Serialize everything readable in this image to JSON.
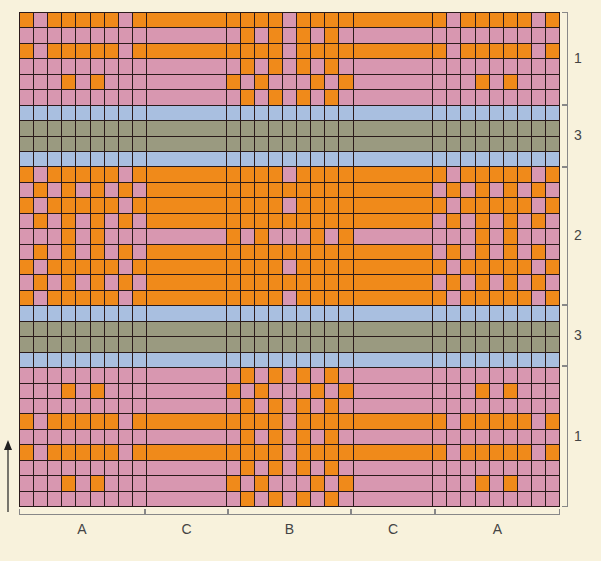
{
  "colors": {
    "O": "#f08a1a",
    "P": "#d897b0",
    "B": "#a9bfe0",
    "G": "#9a9a80"
  },
  "column_sections": [
    {
      "id": "A",
      "label": "A",
      "type": "grid",
      "cols": 9
    },
    {
      "id": "C",
      "label": "C",
      "type": "stripe",
      "cols": 1
    },
    {
      "id": "B",
      "label": "B",
      "type": "grid",
      "cols": 9
    },
    {
      "id": "C",
      "label": "C",
      "type": "stripe",
      "cols": 1
    },
    {
      "id": "A",
      "label": "A",
      "type": "grid",
      "cols": 9
    }
  ],
  "row_sections": [
    {
      "label": "1",
      "rows": 6
    },
    {
      "label": "3",
      "rows": 4
    },
    {
      "label": "2",
      "rows": 9
    },
    {
      "label": "3",
      "rows": 4
    },
    {
      "label": "1",
      "rows": 9
    }
  ],
  "rows": [
    {
      "A": "OPOOOOOPO",
      "C": "O",
      "B": "OOOOPOOOO"
    },
    {
      "A": "PPPPPPPPP",
      "C": "P",
      "B": "POPOPOPOP"
    },
    {
      "A": "OPOOOOOPO",
      "C": "O",
      "B": "OOOOPOOOO"
    },
    {
      "A": "PPPPPPPPP",
      "C": "P",
      "B": "POPOPOPOP"
    },
    {
      "A": "PPPOPOPPP",
      "C": "P",
      "B": "OPOPPPOPO"
    },
    {
      "A": "PPPPPPPPP",
      "C": "P",
      "B": "POPOPOPOP"
    },
    {
      "A": "BBBBBBBBB",
      "C": "B",
      "B": "BBBBBBBBB"
    },
    {
      "A": "GGGGGGGGG",
      "C": "G",
      "B": "GGGGGGGGG"
    },
    {
      "A": "GGGGGGGGG",
      "C": "G",
      "B": "GGGGGGGGG"
    },
    {
      "A": "BBBBBBBBB",
      "C": "B",
      "B": "BBBBBBBBB"
    },
    {
      "A": "OPOOOOOPO",
      "C": "O",
      "B": "OOOOPOOOO"
    },
    {
      "A": "POPOPOPOP",
      "C": "O",
      "B": "OOOOOOOOO"
    },
    {
      "A": "OPOOOOOPO",
      "C": "O",
      "B": "OOOOPOOOO"
    },
    {
      "A": "POPOPOPOP",
      "C": "O",
      "B": "OOOOOOOOO"
    },
    {
      "A": "PPPOPOPPP",
      "C": "P",
      "B": "OPOPPPOPO"
    },
    {
      "A": "POPOPOPOP",
      "C": "O",
      "B": "OOOOOOOOO"
    },
    {
      "A": "OPOOOOOPO",
      "C": "O",
      "B": "OOOOPOOOO"
    },
    {
      "A": "POPOPOPOP",
      "C": "O",
      "B": "OOOOOOOOO"
    },
    {
      "A": "OPOOOOOPO",
      "C": "O",
      "B": "OOOOPOOOO"
    },
    {
      "A": "BBBBBBBBB",
      "C": "B",
      "B": "BBBBBBBBB"
    },
    {
      "A": "GGGGGGGGG",
      "C": "G",
      "B": "GGGGGGGGG"
    },
    {
      "A": "GGGGGGGGG",
      "C": "G",
      "B": "GGGGGGGGG"
    },
    {
      "A": "BBBBBBBBB",
      "C": "B",
      "B": "BBBBBBBBB"
    },
    {
      "A": "PPPPPPPPP",
      "C": "P",
      "B": "POPOPOPOP"
    },
    {
      "A": "PPPOPOPPP",
      "C": "P",
      "B": "OPOPPPOPO"
    },
    {
      "A": "PPPPPPPPP",
      "C": "P",
      "B": "POPOPOPOP"
    },
    {
      "A": "OPOOOOOPO",
      "C": "O",
      "B": "OOOOPOOOO"
    },
    {
      "A": "PPPPPPPPP",
      "C": "P",
      "B": "POPOPOPOP"
    },
    {
      "A": "OPOOOOOPO",
      "C": "O",
      "B": "OOOOPOOOO"
    },
    {
      "A": "PPPPPPPPP",
      "C": "P",
      "B": "POPOPOPOP"
    },
    {
      "A": "PPPOPOPPP",
      "C": "P",
      "B": "OPOPPPOPO"
    },
    {
      "A": "PPPPPPPPP",
      "C": "P",
      "B": "POPOPOPOP"
    }
  ],
  "right_labels": [
    {
      "text": "1",
      "top": 12,
      "bottom": 105
    },
    {
      "text": "3",
      "top": 105,
      "bottom": 167
    },
    {
      "text": "2",
      "top": 167,
      "bottom": 305
    },
    {
      "text": "3",
      "top": 305,
      "bottom": 366
    },
    {
      "text": "1",
      "top": 366,
      "bottom": 507
    }
  ],
  "bottom_labels": [
    {
      "text": "A",
      "left": 19,
      "right": 145
    },
    {
      "text": "C",
      "left": 145,
      "right": 228
    },
    {
      "text": "B",
      "left": 228,
      "right": 351
    },
    {
      "text": "C",
      "left": 351,
      "right": 435
    },
    {
      "text": "A",
      "left": 435,
      "right": 560
    }
  ],
  "arrow": {
    "direction": "up"
  }
}
